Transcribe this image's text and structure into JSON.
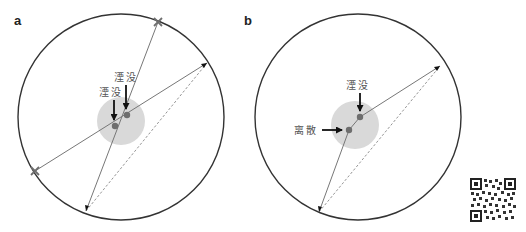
{
  "panels": [
    {
      "id": "a",
      "label": "a",
      "labels": {
        "annihilation_1": "湮没",
        "annihilation_2": "湮没"
      }
    },
    {
      "id": "b",
      "label": "b",
      "labels": {
        "annihilation": "湮没",
        "scatter": "离散"
      }
    }
  ],
  "colors": {
    "circle_stroke": "#333333",
    "line": "#777777",
    "dashed_line": "#888888",
    "source_disc": "#d9d9d9",
    "event_dot": "#6e6e6e",
    "arrow": "#111111",
    "marker_x": "#6e6e6e"
  },
  "qr_code": {
    "present": true
  }
}
